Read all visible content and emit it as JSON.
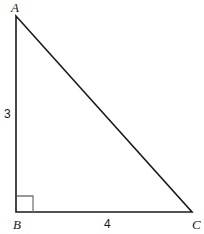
{
  "figure": {
    "kind": "right-triangle-diagram",
    "background_color": "#ffffff",
    "stroke_color": "#1a1a1a",
    "right_angle_marker_color": "#777777",
    "canvas": {
      "width": 204,
      "height": 234
    }
  },
  "vertices": {
    "a": {
      "label": "A",
      "x": 16,
      "y": 16
    },
    "b": {
      "label": "B",
      "x": 16,
      "y": 212
    },
    "c": {
      "label": "C",
      "x": 192,
      "y": 212
    }
  },
  "sides": {
    "ab": {
      "measure": "3",
      "from": "A",
      "to": "B",
      "orientation": "vertical"
    },
    "bc": {
      "measure": "4",
      "from": "B",
      "to": "C",
      "orientation": "horizontal"
    },
    "ac": {
      "measure": "",
      "from": "A",
      "to": "C",
      "orientation": "hypotenuse"
    }
  },
  "right_angle": {
    "at_vertex": "B",
    "marker_size": 16,
    "marker_color": "#777777"
  },
  "geometry_path": {
    "triangle_points": "16,16 16,212 192,212",
    "marker_points": "17,196 33,196 33,212"
  }
}
